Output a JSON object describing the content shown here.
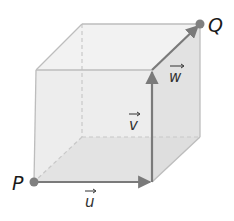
{
  "diagram": {
    "points": [
      {
        "id": "P",
        "label": "P",
        "x": 34,
        "y": 182
      },
      {
        "id": "Q",
        "label": "Q",
        "x": 200,
        "y": 24
      }
    ],
    "vectors": [
      {
        "id": "u",
        "label": "u",
        "from": "P",
        "to": "front-bottom-right"
      },
      {
        "id": "v",
        "label": "v",
        "from": "front-bottom-right",
        "to": "front-top-right"
      },
      {
        "id": "w",
        "label": "w",
        "from": "front-top-right",
        "to": "Q"
      }
    ],
    "colors": {
      "edge": "#bdbdbd",
      "vector": "#7a7a7a",
      "point": "#808080",
      "face": "#e6e6e6"
    }
  }
}
